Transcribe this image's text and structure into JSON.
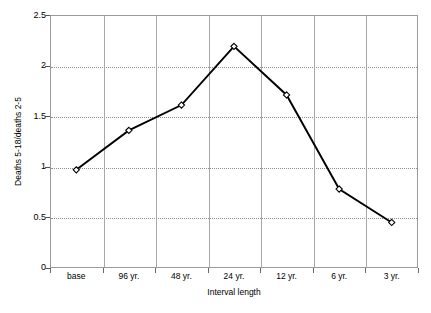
{
  "chart_data": {
    "type": "line",
    "title": "",
    "subtitle": "",
    "xlabel": "Interval length",
    "ylabel": "Deaths 5-18/deaths 2-5",
    "categories": [
      "base",
      "96 yr.",
      "48 yr.",
      "24 yr.",
      "12 yr.",
      "6 yr.",
      "3 yr."
    ],
    "values": [
      0.97,
      1.36,
      1.61,
      2.19,
      1.71,
      0.78,
      0.45
    ],
    "series": [
      {
        "name": "Deaths 5-18/deaths 2-5",
        "values": [
          0.97,
          1.36,
          1.61,
          2.19,
          1.71,
          0.78,
          0.45
        ]
      }
    ],
    "ylim": [
      0,
      2.5
    ],
    "yticks": [
      "0",
      "0.5",
      "1",
      "1.5",
      "2",
      "2.5"
    ],
    "ytick_values": [
      0,
      0.5,
      1,
      1.5,
      2,
      2.5
    ],
    "grid": "horizontal-dotted-and-vertical-solid",
    "legend": "none",
    "marker": "open-diamond",
    "line_color": "#000000",
    "marker_fill": "#ffffff",
    "grid_color": "#8d8d8d",
    "axis_color": "#9a9a9a",
    "background": "#ffffff"
  }
}
